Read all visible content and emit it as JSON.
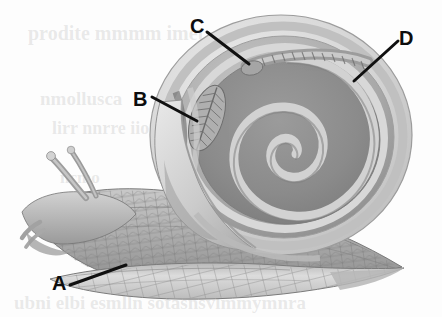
{
  "figure": {
    "width": 442,
    "height": 317,
    "background_color": "#fdfdfd",
    "style": "grayscale scientific illustration"
  },
  "labels": [
    {
      "id": "A",
      "text": "A",
      "x": 52,
      "y": 273,
      "points_to": "foot / muscular sole of the snail",
      "leader": {
        "x1": 70,
        "y1": 285,
        "x2": 126,
        "y2": 265
      }
    },
    {
      "id": "B",
      "text": "B",
      "x": 133,
      "y": 89,
      "points_to": "gill / ctenidium feather-like organ inside mantle cavity",
      "leader": {
        "x1": 152,
        "y1": 97,
        "x2": 197,
        "y2": 121
      }
    },
    {
      "id": "C",
      "text": "C",
      "x": 190,
      "y": 16,
      "points_to": "ridged visceral organ at top whorl of shell",
      "leader": {
        "x1": 207,
        "y1": 32,
        "x2": 249,
        "y2": 64
      }
    },
    {
      "id": "D",
      "text": "D",
      "x": 399,
      "y": 28,
      "points_to": "outer shell wall / whorl band",
      "leader": {
        "x1": 398,
        "y1": 41,
        "x2": 354,
        "y2": 81
      }
    }
  ],
  "colors": {
    "label_text": "#0d0d0d",
    "leader_line": "#101010",
    "shell_outer_light": "#dcdcdc",
    "shell_rim_mid": "#b4b4b4",
    "shell_band_dark": "#8a8a8a",
    "shell_interior": "#8e8e8e",
    "shell_spiral_light": "#cfcfcf",
    "body_light": "#d6d6d6",
    "body_mid": "#a8a8a8",
    "body_dark": "#7d7d7d",
    "background": "#fdfdfd",
    "bleedthrough_text": "rgba(150,150,150,0.20)"
  },
  "bleedthrough": {
    "note": "faint mirrored text showing through from reverse of printed page; illegible",
    "lines": [
      {
        "text": "prodite mmmm imet",
        "x": 28,
        "y": 22,
        "size": 20
      },
      {
        "text": "nmollusca",
        "x": 40,
        "y": 88,
        "size": 19
      },
      {
        "text": "lirr nnrre iio",
        "x": 52,
        "y": 118,
        "size": 18
      },
      {
        "text": "ncmo",
        "x": 60,
        "y": 168,
        "size": 17
      },
      {
        "text": "ubni elbi esmlln sotasnsvlmmymnra",
        "x": 14,
        "y": 292,
        "size": 19
      }
    ]
  }
}
